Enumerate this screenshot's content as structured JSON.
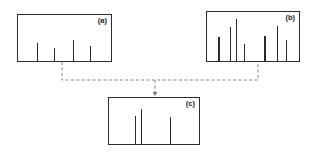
{
  "figure": {
    "title": "",
    "background_color": "#ffffff",
    "stroke_color": "#2b2b2b",
    "connector_color": "#777777",
    "panels": [
      {
        "id": "a",
        "label": "(a)",
        "x": 17,
        "y": 14,
        "width": 95,
        "height": 48,
        "peaks": [
          {
            "x_pct": 20,
            "height_pct": 38
          },
          {
            "x_pct": 38,
            "height_pct": 28
          },
          {
            "x_pct": 58,
            "height_pct": 44
          },
          {
            "x_pct": 76,
            "height_pct": 32
          }
        ]
      },
      {
        "id": "b",
        "label": "(b)",
        "x": 206,
        "y": 11,
        "width": 94,
        "height": 51,
        "peaks": [
          {
            "x_pct": 12,
            "height_pct": 48
          },
          {
            "x_pct": 24,
            "height_pct": 66
          },
          {
            "x_pct": 31,
            "height_pct": 82
          },
          {
            "x_pct": 39,
            "height_pct": 34
          },
          {
            "x_pct": 61,
            "height_pct": 50
          },
          {
            "x_pct": 74,
            "height_pct": 68
          },
          {
            "x_pct": 84,
            "height_pct": 42
          }
        ]
      },
      {
        "id": "c",
        "label": "(c)",
        "x": 108,
        "y": 97,
        "width": 92,
        "height": 48,
        "peaks": [
          {
            "x_pct": 28,
            "height_pct": 58
          },
          {
            "x_pct": 35,
            "height_pct": 72
          },
          {
            "x_pct": 66,
            "height_pct": 56
          }
        ]
      }
    ],
    "connector": {
      "style": "dashed",
      "source_a_x": 62,
      "source_b_x": 258,
      "bus_y": 80,
      "target_x": 155,
      "target_y": 96,
      "arrowhead": true
    }
  }
}
